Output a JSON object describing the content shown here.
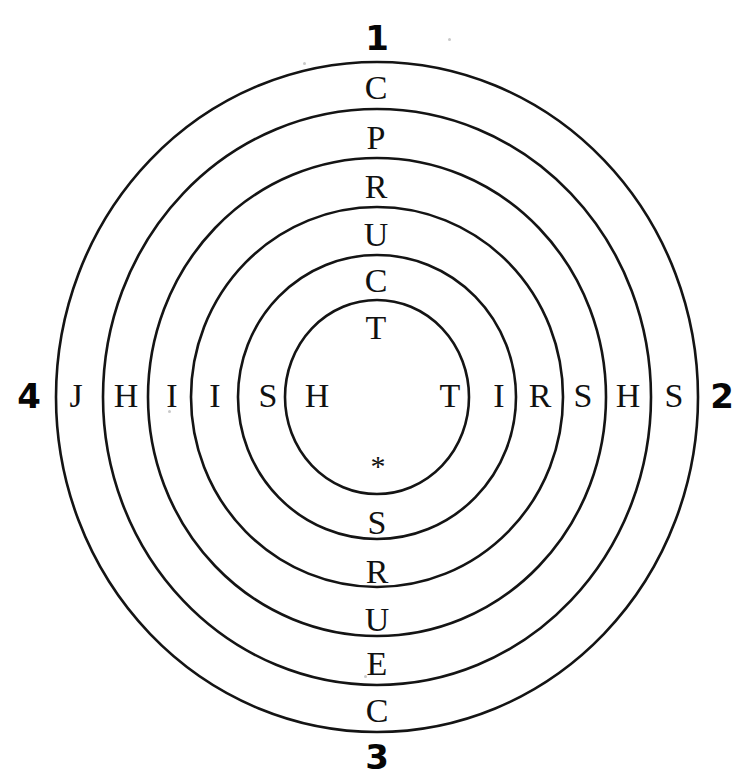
{
  "figure": {
    "background_color": "#ffffff",
    "stroke_color": "#141414",
    "text_color": "#111111",
    "ring_count": 6
  },
  "direction_labels": {
    "top": "1",
    "right": "2",
    "bottom": "3",
    "left": "4"
  },
  "arms": {
    "top_outer_to_inner": [
      "C",
      "P",
      "R",
      "U",
      "C",
      "T"
    ],
    "bottom_inner_to_outer": [
      "*",
      "S",
      "R",
      "U",
      "E",
      "C"
    ],
    "left_outer_to_inner": [
      "J",
      "H",
      "I",
      "I",
      "S",
      "H"
    ],
    "right_inner_to_outer": [
      "T",
      "I",
      "R",
      "S",
      "H",
      "S"
    ]
  },
  "horizontal_row_left_to_right": [
    "4",
    "J",
    "H",
    "I",
    "I",
    "S",
    "H",
    "T",
    "I",
    "R",
    "S",
    "H",
    "S",
    "2"
  ],
  "vertical_column_top_to_bottom": [
    "1",
    "C",
    "P",
    "R",
    "U",
    "C",
    "T",
    "*",
    "S",
    "R",
    "U",
    "E",
    "C",
    "3"
  ],
  "glyphs": [
    {
      "name": "top-ring-1-letter",
      "text": "C",
      "x": 376,
      "y": 88,
      "kind": "letter"
    },
    {
      "name": "top-ring-2-letter",
      "text": "P",
      "x": 376,
      "y": 138,
      "kind": "letter"
    },
    {
      "name": "top-ring-3-letter",
      "text": "R",
      "x": 376,
      "y": 187,
      "kind": "letter"
    },
    {
      "name": "top-ring-4-letter",
      "text": "U",
      "x": 376,
      "y": 235,
      "kind": "letter"
    },
    {
      "name": "top-ring-5-letter",
      "text": "C",
      "x": 376,
      "y": 281,
      "kind": "letter"
    },
    {
      "name": "top-ring-6-letter",
      "text": "T",
      "x": 376,
      "y": 328,
      "kind": "letter"
    },
    {
      "name": "center-star",
      "text": "*",
      "x": 378,
      "y": 466,
      "kind": "star"
    },
    {
      "name": "bottom-ring-5-letter",
      "text": "S",
      "x": 377,
      "y": 523,
      "kind": "letter"
    },
    {
      "name": "bottom-ring-4-letter",
      "text": "R",
      "x": 377,
      "y": 572,
      "kind": "letter"
    },
    {
      "name": "bottom-ring-3-letter",
      "text": "U",
      "x": 377,
      "y": 620,
      "kind": "letter"
    },
    {
      "name": "bottom-ring-2-letter",
      "text": "E",
      "x": 377,
      "y": 664,
      "kind": "letter"
    },
    {
      "name": "bottom-ring-1-letter",
      "text": "C",
      "x": 377,
      "y": 711,
      "kind": "letter"
    },
    {
      "name": "left-ring-1-letter",
      "text": "J",
      "x": 76,
      "y": 396,
      "kind": "letter"
    },
    {
      "name": "left-ring-2-letter",
      "text": "H",
      "x": 126,
      "y": 396,
      "kind": "letter"
    },
    {
      "name": "left-ring-3-letter",
      "text": "I",
      "x": 172,
      "y": 396,
      "kind": "letter"
    },
    {
      "name": "left-ring-4-letter",
      "text": "I",
      "x": 215,
      "y": 396,
      "kind": "letter"
    },
    {
      "name": "left-ring-5-letter",
      "text": "S",
      "x": 268,
      "y": 396,
      "kind": "letter"
    },
    {
      "name": "left-ring-6-letter",
      "text": "H",
      "x": 317,
      "y": 396,
      "kind": "letter"
    },
    {
      "name": "right-ring-6-letter",
      "text": "T",
      "x": 450,
      "y": 396,
      "kind": "letter"
    },
    {
      "name": "right-ring-5-letter",
      "text": "I",
      "x": 499,
      "y": 396,
      "kind": "letter"
    },
    {
      "name": "right-ring-4-letter",
      "text": "R",
      "x": 540,
      "y": 396,
      "kind": "letter"
    },
    {
      "name": "right-ring-3-letter",
      "text": "S",
      "x": 583,
      "y": 396,
      "kind": "letter"
    },
    {
      "name": "right-ring-2-letter",
      "text": "H",
      "x": 628,
      "y": 396,
      "kind": "letter"
    },
    {
      "name": "right-ring-1-letter",
      "text": "S",
      "x": 674,
      "y": 396,
      "kind": "letter"
    }
  ],
  "numbers": [
    {
      "name": "direction-number-top",
      "text": "1",
      "x": 377,
      "y": 38
    },
    {
      "name": "direction-number-right",
      "text": "2",
      "x": 722,
      "y": 396
    },
    {
      "name": "direction-number-bottom",
      "text": "3",
      "x": 377,
      "y": 757
    },
    {
      "name": "direction-number-left",
      "text": "4",
      "x": 29,
      "y": 396
    }
  ],
  "rings": [
    {
      "name": "ring-outer-1",
      "cx": 377,
      "cy": 397,
      "rx": 321,
      "ry": 335
    },
    {
      "name": "ring-2",
      "cx": 377,
      "cy": 397,
      "rx": 274,
      "ry": 288
    },
    {
      "name": "ring-3",
      "cx": 377,
      "cy": 397,
      "rx": 229,
      "ry": 239
    },
    {
      "name": "ring-4",
      "cx": 377,
      "cy": 397,
      "rx": 186,
      "ry": 190
    },
    {
      "name": "ring-5",
      "cx": 377,
      "cy": 397,
      "rx": 139,
      "ry": 142
    },
    {
      "name": "ring-inner-6",
      "cx": 377,
      "cy": 397,
      "rx": 92,
      "ry": 97
    }
  ]
}
